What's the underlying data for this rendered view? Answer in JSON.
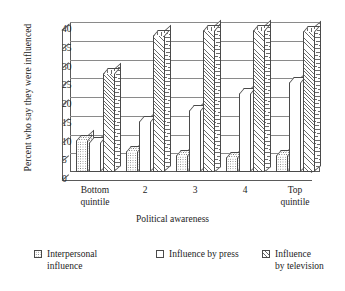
{
  "chart_data": {
    "type": "bar",
    "title": "",
    "xlabel": "Political awareness",
    "ylabel": "Percent who say they were influenced",
    "categories": [
      "Bottom quintile",
      "2",
      "3",
      "4",
      "Top quintile"
    ],
    "category_lines": [
      [
        "Bottom",
        "quintile"
      ],
      [
        "2"
      ],
      [
        "3"
      ],
      [
        "4"
      ],
      [
        "Top",
        "quintile"
      ]
    ],
    "ylim": [
      0,
      40
    ],
    "ytick_step": 5,
    "yticks": [
      0,
      5,
      10,
      15,
      20,
      25,
      30,
      35,
      40
    ],
    "grid": true,
    "legend_position": "bottom",
    "series": [
      {
        "name": "Interpersonal influence",
        "legend_lines": [
          "Interpersonal",
          "influence"
        ],
        "pattern": "dots",
        "values": [
          8.5,
          5.5,
          4.5,
          4,
          4.5
        ]
      },
      {
        "name": "Influence by press",
        "legend_lines": [
          "Influence by press"
        ],
        "pattern": "plain",
        "values": [
          8,
          13.5,
          16.5,
          21,
          24
        ]
      },
      {
        "name": "Influence by television",
        "legend_lines": [
          "Influence",
          "by television"
        ],
        "pattern": "hatch",
        "values": [
          26.5,
          36.5,
          38,
          38,
          37.5
        ]
      }
    ]
  }
}
